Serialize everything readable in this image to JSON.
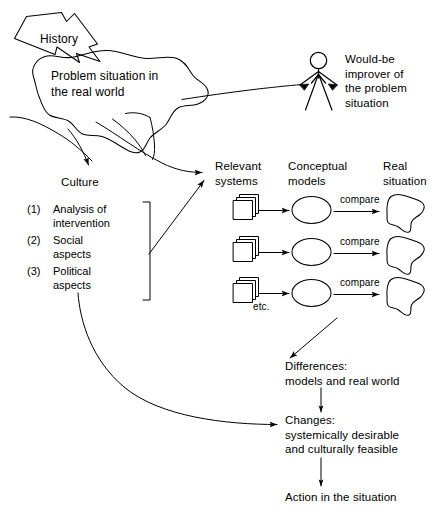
{
  "diagram": {
    "colors": {
      "ink": "#000000",
      "background": "#ffffff"
    },
    "history_banner": {
      "label": "History"
    },
    "problem_blob": {
      "label": "Problem situation in\nthe real world"
    },
    "actor": {
      "icon": "stick-figure-icon",
      "label": "Would-be\nimprover of\nthe problem\nsituation"
    },
    "culture": {
      "label": "Culture"
    },
    "culture_list": [
      {
        "num": "(1)",
        "text": "Analysis of\nintervention"
      },
      {
        "num": "(2)",
        "text": "Social\naspects"
      },
      {
        "num": "(3)",
        "text": "Political\naspects"
      }
    ],
    "columns": [
      {
        "key": "relevant_systems",
        "label": "Relevant\nsystems"
      },
      {
        "key": "conceptual_models",
        "label": "Conceptual\nmodels"
      },
      {
        "key": "real_situation",
        "label": "Real\nsituation"
      }
    ],
    "rows": [
      {
        "compare_label": "compare"
      },
      {
        "compare_label": "compare"
      },
      {
        "compare_label": "compare"
      }
    ],
    "etc": {
      "label": "etc."
    },
    "differences": {
      "label": "Differences:\nmodels and real world"
    },
    "changes": {
      "label": "Changes:\nsystemically desirable\nand culturally feasible"
    },
    "action": {
      "label": "Action in the situation"
    }
  }
}
